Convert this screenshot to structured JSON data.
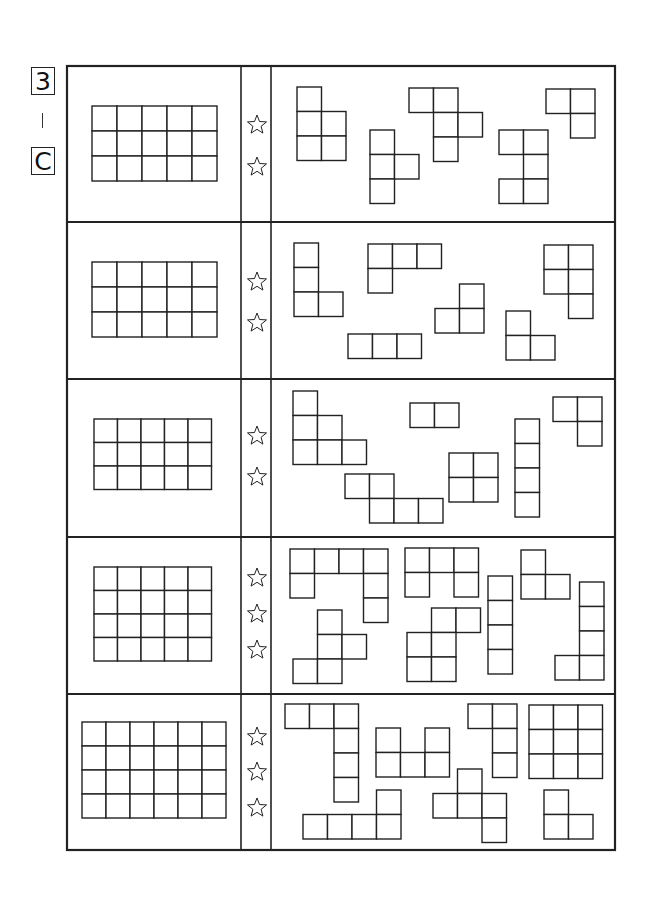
{
  "header": {
    "level": "3",
    "separator": "|",
    "section": "C"
  },
  "colors": {
    "line": "#222222",
    "background": "#ffffff"
  },
  "frame": {
    "x": 67,
    "y": 66,
    "w": 548,
    "h": 784,
    "col_dividers": [
      241,
      271
    ],
    "row_dividers": [
      222,
      379,
      537,
      694
    ]
  },
  "rows": [
    {
      "difficulty_stars": 2,
      "target_grid": {
        "x": 92,
        "y": 106,
        "cols": 5,
        "rows": 3,
        "cell": 25
      },
      "star_y": [
        125,
        167
      ],
      "pieces": [
        {
          "x": 297,
          "y": 87,
          "cells": [
            [
              0,
              0
            ],
            [
              0,
              1
            ],
            [
              1,
              1
            ],
            [
              0,
              2
            ],
            [
              1,
              2
            ]
          ]
        },
        {
          "x": 370,
          "y": 130,
          "cells": [
            [
              0,
              0
            ],
            [
              0,
              1
            ],
            [
              1,
              1
            ],
            [
              0,
              2
            ]
          ]
        },
        {
          "x": 409,
          "y": 88,
          "cells": [
            [
              0,
              0
            ],
            [
              1,
              0
            ],
            [
              1,
              1
            ],
            [
              2,
              1
            ],
            [
              1,
              2
            ]
          ]
        },
        {
          "x": 546,
          "y": 89,
          "cells": [
            [
              0,
              0
            ],
            [
              1,
              0
            ],
            [
              1,
              1
            ]
          ]
        },
        {
          "x": 499,
          "y": 130,
          "cells": [
            [
              0,
              0
            ],
            [
              1,
              0
            ],
            [
              1,
              1
            ],
            [
              0,
              2
            ],
            [
              1,
              2
            ]
          ]
        }
      ]
    },
    {
      "difficulty_stars": 2,
      "target_grid": {
        "x": 92,
        "y": 262,
        "cols": 5,
        "rows": 3,
        "cell": 25
      },
      "star_y": [
        282,
        323
      ],
      "pieces": [
        {
          "x": 294,
          "y": 243,
          "cells": [
            [
              0,
              0
            ],
            [
              0,
              1
            ],
            [
              0,
              2
            ],
            [
              1,
              2
            ]
          ]
        },
        {
          "x": 368,
          "y": 244,
          "cells": [
            [
              0,
              0
            ],
            [
              1,
              0
            ],
            [
              2,
              0
            ],
            [
              0,
              1
            ]
          ]
        },
        {
          "x": 348,
          "y": 334,
          "cells": [
            [
              0,
              0
            ],
            [
              1,
              0
            ],
            [
              2,
              0
            ]
          ]
        },
        {
          "x": 435,
          "y": 284,
          "cells": [
            [
              1,
              0
            ],
            [
              0,
              1
            ],
            [
              1,
              1
            ]
          ]
        },
        {
          "x": 506,
          "y": 311,
          "cells": [
            [
              0,
              0
            ],
            [
              0,
              1
            ],
            [
              1,
              1
            ]
          ]
        },
        {
          "x": 544,
          "y": 245,
          "cells": [
            [
              0,
              0
            ],
            [
              1,
              0
            ],
            [
              0,
              1
            ],
            [
              1,
              1
            ],
            [
              1,
              2
            ]
          ]
        }
      ]
    },
    {
      "difficulty_stars": 2,
      "target_grid": {
        "x": 94,
        "y": 419,
        "cols": 5,
        "rows": 3,
        "cell": 23.5
      },
      "star_y": [
        436,
        477
      ],
      "pieces": [
        {
          "x": 293,
          "y": 391,
          "cells": [
            [
              0,
              0
            ],
            [
              0,
              1
            ],
            [
              1,
              1
            ],
            [
              0,
              2
            ],
            [
              1,
              2
            ],
            [
              2,
              2
            ]
          ]
        },
        {
          "x": 410,
          "y": 403,
          "cells": [
            [
              0,
              0
            ],
            [
              1,
              0
            ]
          ]
        },
        {
          "x": 345,
          "y": 474,
          "cells": [
            [
              0,
              0
            ],
            [
              1,
              0
            ],
            [
              1,
              1
            ],
            [
              2,
              1
            ],
            [
              3,
              1
            ]
          ]
        },
        {
          "x": 449,
          "y": 453,
          "cells": [
            [
              0,
              0
            ],
            [
              1,
              0
            ],
            [
              0,
              1
            ],
            [
              1,
              1
            ]
          ]
        },
        {
          "x": 515,
          "y": 419,
          "cells": [
            [
              0,
              0
            ],
            [
              0,
              1
            ],
            [
              0,
              2
            ],
            [
              0,
              3
            ]
          ]
        },
        {
          "x": 553,
          "y": 397,
          "cells": [
            [
              0,
              0
            ],
            [
              1,
              0
            ],
            [
              1,
              1
            ]
          ]
        }
      ]
    },
    {
      "difficulty_stars": 3,
      "target_grid": {
        "x": 94,
        "y": 567,
        "cols": 5,
        "rows": 4,
        "cell": 23.5
      },
      "star_y": [
        578,
        614,
        650
      ],
      "pieces": [
        {
          "x": 290,
          "y": 549,
          "cells": [
            [
              0,
              0
            ],
            [
              1,
              0
            ],
            [
              2,
              0
            ],
            [
              3,
              0
            ],
            [
              0,
              1
            ],
            [
              3,
              1
            ],
            [
              3,
              2
            ]
          ]
        },
        {
          "x": 405,
          "y": 548,
          "cells": [
            [
              0,
              0
            ],
            [
              1,
              0
            ],
            [
              2,
              0
            ],
            [
              0,
              1
            ],
            [
              2,
              1
            ]
          ]
        },
        {
          "x": 293,
          "y": 610,
          "cells": [
            [
              1,
              0
            ],
            [
              1,
              1
            ],
            [
              2,
              1
            ],
            [
              0,
              2
            ],
            [
              1,
              2
            ]
          ]
        },
        {
          "x": 407,
          "y": 608,
          "cells": [
            [
              1,
              0
            ],
            [
              2,
              0
            ],
            [
              0,
              1
            ],
            [
              1,
              1
            ],
            [
              0,
              2
            ],
            [
              1,
              2
            ]
          ]
        },
        {
          "x": 488,
          "y": 576,
          "cells": [
            [
              0,
              0
            ],
            [
              0,
              1
            ],
            [
              0,
              2
            ],
            [
              0,
              3
            ]
          ]
        },
        {
          "x": 521,
          "y": 550,
          "cells": [
            [
              0,
              0
            ],
            [
              0,
              1
            ],
            [
              1,
              1
            ]
          ]
        },
        {
          "x": 555,
          "y": 582,
          "cells": [
            [
              1,
              0
            ],
            [
              1,
              1
            ],
            [
              1,
              2
            ],
            [
              0,
              3
            ],
            [
              1,
              3
            ]
          ]
        }
      ]
    },
    {
      "difficulty_stars": 3,
      "target_grid": {
        "x": 82,
        "y": 722,
        "cols": 6,
        "rows": 4,
        "cell": 24
      },
      "star_y": [
        737,
        772,
        808
      ],
      "pieces": [
        {
          "x": 285,
          "y": 704,
          "cells": [
            [
              0,
              0
            ],
            [
              1,
              0
            ],
            [
              2,
              0
            ],
            [
              2,
              1
            ],
            [
              2,
              2
            ],
            [
              2,
              3
            ]
          ]
        },
        {
          "x": 376,
          "y": 728,
          "cells": [
            [
              0,
              0
            ],
            [
              2,
              0
            ],
            [
              0,
              1
            ],
            [
              1,
              1
            ],
            [
              2,
              1
            ]
          ]
        },
        {
          "x": 303,
          "y": 790,
          "cells": [
            [
              3,
              0
            ],
            [
              0,
              1
            ],
            [
              1,
              1
            ],
            [
              2,
              1
            ],
            [
              3,
              1
            ]
          ]
        },
        {
          "x": 468,
          "y": 704,
          "cells": [
            [
              0,
              0
            ],
            [
              1,
              0
            ],
            [
              1,
              1
            ],
            [
              1,
              2
            ]
          ]
        },
        {
          "x": 529,
          "y": 705,
          "cells": [
            [
              0,
              0
            ],
            [
              1,
              0
            ],
            [
              2,
              0
            ],
            [
              0,
              1
            ],
            [
              1,
              1
            ],
            [
              2,
              1
            ],
            [
              0,
              2
            ],
            [
              1,
              2
            ],
            [
              2,
              2
            ]
          ]
        },
        {
          "x": 433,
          "y": 769,
          "cells": [
            [
              1,
              0
            ],
            [
              0,
              1
            ],
            [
              1,
              1
            ],
            [
              2,
              1
            ],
            [
              2,
              2
            ]
          ]
        },
        {
          "x": 544,
          "y": 790,
          "cells": [
            [
              0,
              0
            ],
            [
              0,
              1
            ],
            [
              1,
              1
            ]
          ]
        }
      ]
    }
  ],
  "piece_cell": 24.5,
  "star_x": 257,
  "icons": {
    "star": "star-outline-icon"
  }
}
